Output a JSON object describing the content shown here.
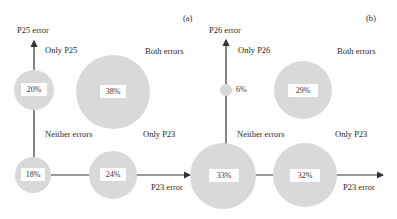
{
  "panels": [
    {
      "id": "a",
      "tag": "(a)",
      "y_axis_label": "P25 error",
      "x_axis_label": "P23 error",
      "quadrants": {
        "top_left": "Only P25",
        "top_right": "Both errors",
        "bottom_left": "Neither errors",
        "bottom_right": "Only P23"
      },
      "values": {
        "only_y": "20%",
        "both": "38%",
        "neither": "18%",
        "only_x": "24%"
      }
    },
    {
      "id": "b",
      "tag": "(b)",
      "y_axis_label": "P26 error",
      "x_axis_label": "P23 error",
      "quadrants": {
        "top_left": "Only P26",
        "top_right": "Both errors",
        "bottom_left": "Neither errors",
        "bottom_right": "Only P23"
      },
      "values": {
        "only_y": "6%",
        "both": "29%",
        "neither": "33%",
        "only_x": "32%"
      }
    }
  ],
  "colors": {
    "circle_fill": "#d9d9d9",
    "axis": "#333333"
  }
}
